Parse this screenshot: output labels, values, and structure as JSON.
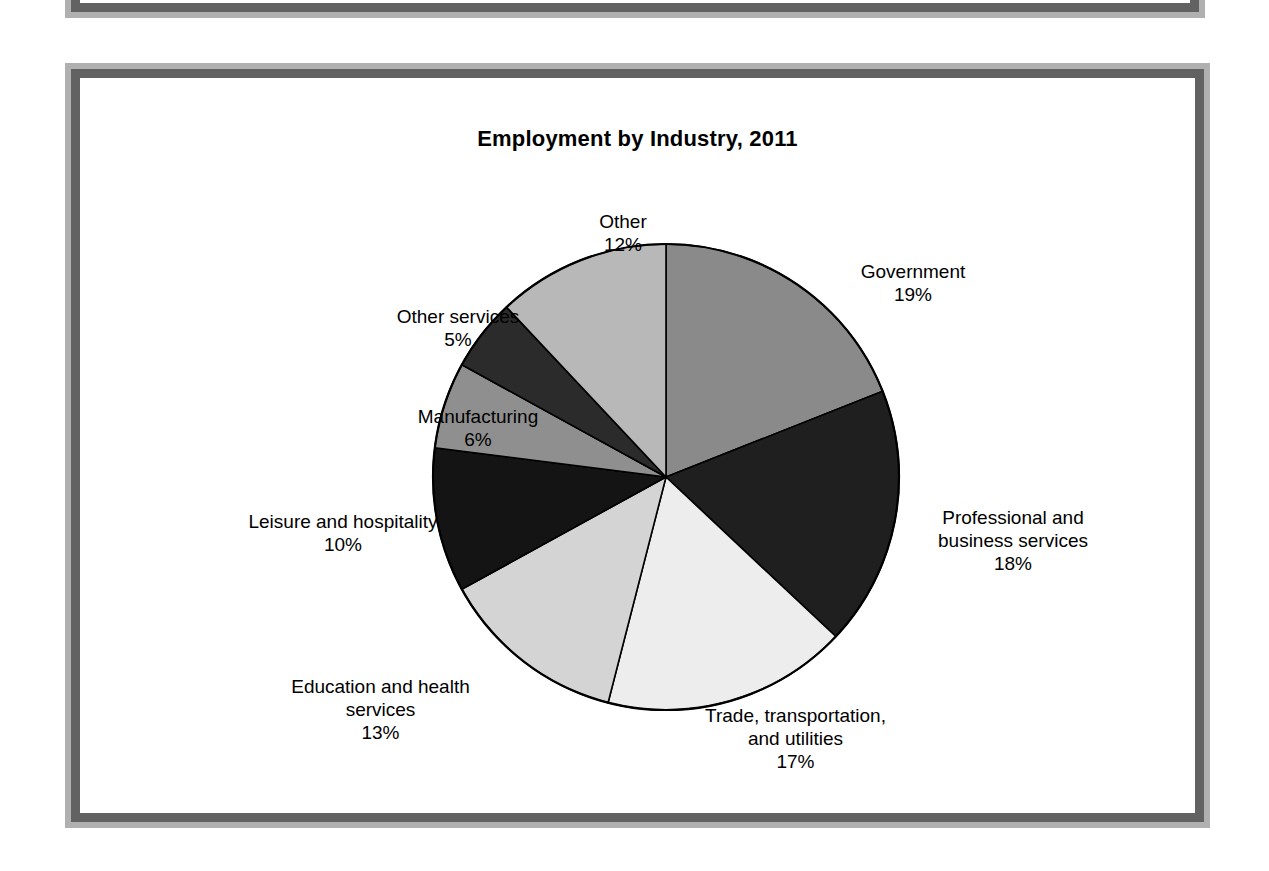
{
  "figure": {
    "title": "Employment by Industry, 2011",
    "background": "#ffffff",
    "frame_outer_color": "#b0b0b0",
    "frame_inner_color": "#626262"
  },
  "chart_data": {
    "type": "pie",
    "title": "Employment by Industry, 2011",
    "xlabel": "",
    "ylabel": "",
    "start_angle_oclock": 12,
    "direction": "clockwise",
    "units": "percent",
    "legend": "none (direct labels with leader placement)",
    "grid": false,
    "categories": [
      "Government",
      "Professional and business services",
      "Trade, transportation, and utilities",
      "Education and health services",
      "Leisure and hospitality",
      "Manufacturing",
      "Other services",
      "Other"
    ],
    "values": [
      19,
      18,
      17,
      13,
      10,
      6,
      5,
      12
    ],
    "slices": [
      {
        "label": "Government",
        "value": 19,
        "pct_text": "19%",
        "color": "#8a8a8a",
        "label_lines": [
          "Government"
        ]
      },
      {
        "label": "Professional and business services",
        "value": 18,
        "pct_text": "18%",
        "color": "#1f1f1f",
        "label_lines": [
          "Professional and",
          "business services"
        ]
      },
      {
        "label": "Trade, transportation, and utilities",
        "value": 17,
        "pct_text": "17%",
        "color": "#ededed",
        "label_lines": [
          "Trade, transportation,",
          "and utilities"
        ]
      },
      {
        "label": "Education and health services",
        "value": 13,
        "pct_text": "13%",
        "color": "#d4d4d4",
        "label_lines": [
          "Education and health",
          "services"
        ]
      },
      {
        "label": "Leisure and hospitality",
        "value": 10,
        "pct_text": "10%",
        "color": "#141414",
        "label_lines": [
          "Leisure and hospitality"
        ]
      },
      {
        "label": "Manufacturing",
        "value": 6,
        "pct_text": "6%",
        "color": "#8f8f8f",
        "label_lines": [
          "Manufacturing"
        ]
      },
      {
        "label": "Other services",
        "value": 5,
        "pct_text": "5%",
        "color": "#2b2b2b",
        "label_lines": [
          "Other services"
        ]
      },
      {
        "label": "Other",
        "value": 12,
        "pct_text": "12%",
        "color": "#b8b8b8",
        "label_lines": [
          "Other"
        ]
      }
    ]
  },
  "labels": {
    "government": {
      "line1": "Government",
      "pct": "19%"
    },
    "professional": {
      "line1": "Professional and",
      "line2": "business services",
      "pct": "18%"
    },
    "trade": {
      "line1": "Trade, transportation,",
      "line2": "and utilities",
      "pct": "17%"
    },
    "education": {
      "line1": "Education and health",
      "line2": "services",
      "pct": "13%"
    },
    "leisure": {
      "line1": "Leisure and hospitality",
      "pct": "10%"
    },
    "manufacturing": {
      "line1": "Manufacturing",
      "pct": "6%"
    },
    "other_services": {
      "line1": "Other services",
      "pct": "5%"
    },
    "other": {
      "line1": "Other",
      "pct": "12%"
    }
  }
}
